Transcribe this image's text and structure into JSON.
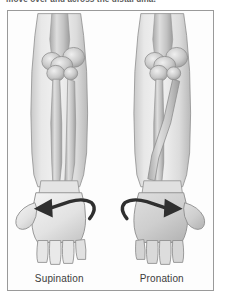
{
  "caption": {
    "text": "move over and across the distal ulna."
  },
  "figure": {
    "border_color": "#9a9a9a",
    "background": "#fdfdfd",
    "panels": [
      {
        "id": "supination",
        "label": "Supination",
        "arrow_icon": "curved-arrow-left-icon",
        "arrow_direction": "left",
        "hand_view": "palm",
        "bones": "parallel",
        "bone_names": [
          "radius",
          "ulna"
        ]
      },
      {
        "id": "pronation",
        "label": "Pronation",
        "arrow_icon": "curved-arrow-right-icon",
        "arrow_direction": "right",
        "hand_view": "dorsum",
        "bones": "crossed",
        "bone_names": [
          "radius",
          "ulna"
        ]
      }
    ]
  },
  "palette": {
    "skin_light": "#ededed",
    "skin_mid": "#d8d8d8",
    "skin_shadow": "#bcbcbc",
    "bone_light": "#e6e6e6",
    "bone_mid": "#c4c4c4",
    "bone_dark": "#9c9c9c",
    "outline": "#8c8c8c",
    "arrow": "#2f2f2f",
    "text": "#3c3c3c"
  }
}
